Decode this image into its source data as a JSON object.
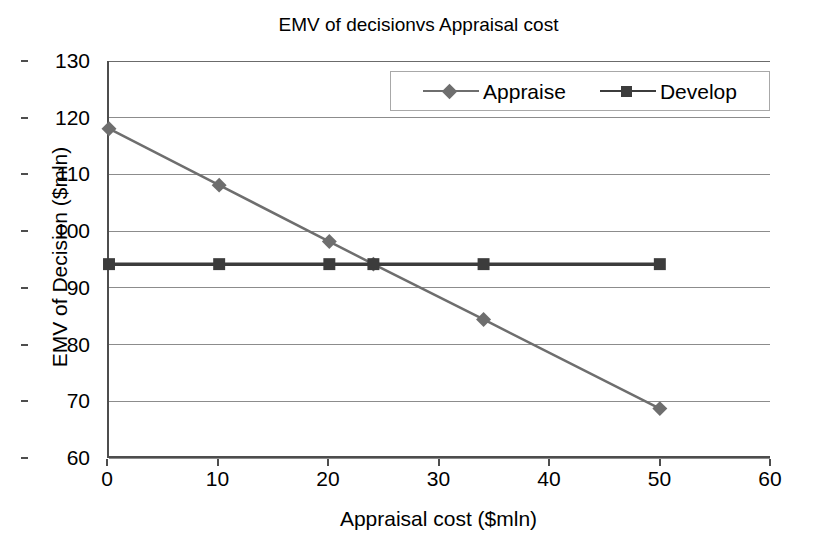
{
  "chart_data": {
    "type": "line",
    "title": "EMV of decisionvs Appraisal cost",
    "xlabel": "Appraisal cost ($mln)",
    "ylabel": "EMV of Decision ($mln)",
    "xlim": [
      0,
      60
    ],
    "ylim": [
      60,
      130
    ],
    "xticks": [
      0,
      10,
      20,
      30,
      40,
      50,
      60
    ],
    "yticks": [
      60,
      70,
      80,
      90,
      100,
      110,
      120,
      130
    ],
    "grid": "horizontal",
    "legend_position": "top-right-inside",
    "series": [
      {
        "name": "Appraise",
        "marker": "diamond",
        "color": "#6e6e6e",
        "x": [
          0,
          10,
          20,
          24,
          34,
          50
        ],
        "values": [
          118,
          108,
          98,
          94,
          84.2,
          68.4
        ]
      },
      {
        "name": "Develop",
        "marker": "square",
        "color": "#3c3c3c",
        "x": [
          0,
          10,
          20,
          24,
          34,
          50
        ],
        "values": [
          94,
          94,
          94,
          94,
          94,
          94
        ]
      }
    ]
  },
  "colors": {
    "axis": "#4d4d4d",
    "gridline": "#8c8c8c",
    "background": "#ffffff",
    "legend_border": "#a8a8a8",
    "appraise": "#6e6e6e",
    "develop": "#3c3c3c"
  }
}
